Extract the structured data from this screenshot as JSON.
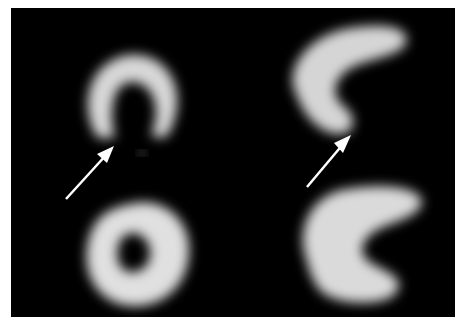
{
  "figure": {
    "background_color": "#000000",
    "frame_color": "#ffffff",
    "panels": [
      {
        "position": "top-left",
        "shape": "horseshoe",
        "view": "vertical long axis",
        "has_arrow": true
      },
      {
        "position": "top-right",
        "shape": "crescent",
        "view": "horizontal long axis",
        "has_arrow": true
      },
      {
        "position": "bottom-left",
        "shape": "ring",
        "view": "short axis"
      },
      {
        "position": "bottom-right",
        "shape": "crescent",
        "view": "long axis"
      }
    ],
    "arrows": [
      {
        "color": "#ffffff",
        "from": [
          66,
          199
        ],
        "to": [
          112,
          148
        ]
      },
      {
        "color": "#ffffff",
        "from": [
          307,
          187
        ],
        "to": [
          349,
          135
        ]
      }
    ]
  }
}
